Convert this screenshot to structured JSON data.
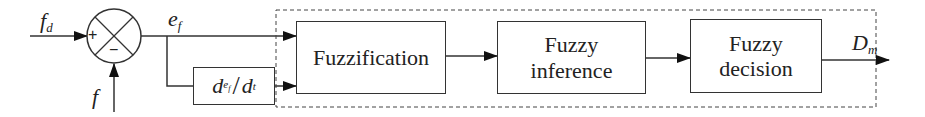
{
  "diagram": {
    "type": "block-diagram",
    "inputs": {
      "setpoint": {
        "symbol": "f",
        "subscript": "d"
      },
      "feedback": {
        "symbol": "f",
        "subscript": ""
      }
    },
    "summing_junction": {
      "plus": "+",
      "minus": "−"
    },
    "error_signal": {
      "symbol": "e",
      "subscript": "f"
    },
    "derivative_block": {
      "numerator": "d",
      "num_sub": "e",
      "num_sub_sub": "f",
      "slash": "/",
      "denominator": "d",
      "den_sub": "t"
    },
    "blocks": [
      {
        "id": "fuzzification",
        "label": "Fuzzification"
      },
      {
        "id": "fuzzy-inference",
        "label_line1": "Fuzzy",
        "label_line2": "inference"
      },
      {
        "id": "fuzzy-decision",
        "label_line1": "Fuzzy",
        "label_line2": "decision"
      }
    ],
    "output": {
      "symbol": "D",
      "subscript": "m"
    },
    "colors": {
      "line": "#333333",
      "text": "#222222",
      "background": "#ffffff"
    }
  }
}
